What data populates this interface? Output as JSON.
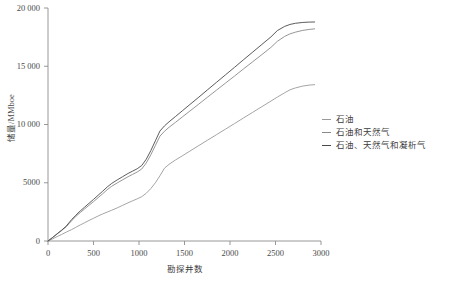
{
  "chart_data": {
    "type": "line",
    "title": "",
    "xlabel": "勘探井数",
    "ylabel": "储量/MMboe",
    "xlim": [
      0,
      3000
    ],
    "ylim": [
      0,
      20000
    ],
    "grid": false,
    "legend_position": "right",
    "xticks": [
      "0",
      "500",
      "1000",
      "1500",
      "2000",
      "2500",
      "3000"
    ],
    "xtick_values": [
      0,
      500,
      1000,
      1500,
      2000,
      2500,
      3000
    ],
    "yticks": [
      "0",
      "5000",
      "10 000",
      "15 000",
      "20 000"
    ],
    "ytick_values": [
      0,
      5000,
      10000,
      15000,
      20000
    ],
    "x": [
      0,
      50,
      100,
      150,
      200,
      230,
      260,
      300,
      330,
      360,
      400,
      450,
      500,
      560,
      600,
      650,
      700,
      760,
      820,
      880,
      930,
      980,
      1030,
      1080,
      1130,
      1180,
      1230,
      1280,
      1330,
      1400,
      1480,
      1560,
      1650,
      1750,
      1850,
      1950,
      2050,
      2150,
      2250,
      2350,
      2450,
      2520,
      2600,
      2660,
      2720,
      2800,
      2870,
      2930
    ],
    "series": [
      {
        "name": "石油",
        "color": "#9a9a9a",
        "values": [
          0,
          180,
          380,
          560,
          760,
          870,
          980,
          1150,
          1280,
          1400,
          1560,
          1760,
          1950,
          2180,
          2320,
          2480,
          2640,
          2840,
          3060,
          3280,
          3450,
          3620,
          3800,
          4100,
          4500,
          5000,
          5600,
          6250,
          6580,
          6950,
          7330,
          7720,
          8160,
          8640,
          9120,
          9600,
          10080,
          10570,
          11050,
          11530,
          12010,
          12350,
          12720,
          12980,
          13140,
          13300,
          13380,
          13420
        ]
      },
      {
        "name": "石油和天然气",
        "color": "#8a8a8a",
        "values": [
          0,
          290,
          600,
          900,
          1220,
          1480,
          1750,
          2060,
          2280,
          2480,
          2740,
          3060,
          3380,
          3780,
          4050,
          4400,
          4700,
          4980,
          5250,
          5520,
          5720,
          5920,
          6180,
          6700,
          7400,
          8200,
          9000,
          9420,
          9760,
          10180,
          10670,
          11160,
          11710,
          12330,
          12940,
          13550,
          14160,
          14780,
          15390,
          16000,
          16620,
          17140,
          17560,
          17780,
          17930,
          18080,
          18160,
          18210
        ]
      },
      {
        "name": "石油、天然气和凝析气",
        "color": "#4a4a4a",
        "values": [
          0,
          300,
          620,
          930,
          1270,
          1560,
          1840,
          2160,
          2400,
          2620,
          2890,
          3230,
          3570,
          3990,
          4270,
          4630,
          4940,
          5240,
          5520,
          5800,
          6000,
          6200,
          6480,
          7020,
          7760,
          8600,
          9440,
          9880,
          10230,
          10680,
          11200,
          11720,
          12300,
          12960,
          13610,
          14260,
          14910,
          15570,
          16220,
          16870,
          17520,
          18060,
          18420,
          18590,
          18690,
          18760,
          18790,
          18800
        ]
      }
    ],
    "legend": [
      {
        "label": "石油",
        "color": "#9a9a9a"
      },
      {
        "label": "石油和天然气",
        "color": "#8a8a8a"
      },
      {
        "label": "石油、天然气和凝析气",
        "color": "#4a4a4a"
      }
    ]
  }
}
